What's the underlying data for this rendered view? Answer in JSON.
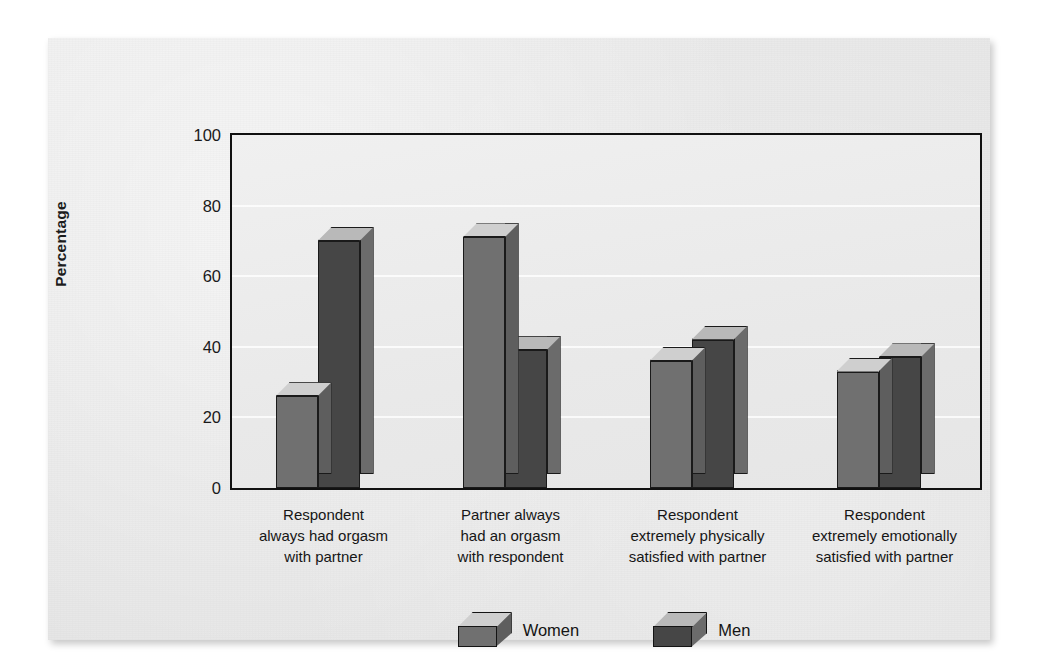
{
  "chart_data": {
    "type": "bar",
    "title": "",
    "xlabel": "",
    "ylabel": "Percentage",
    "ylim": [
      0,
      100
    ],
    "yticks": [
      0,
      20,
      40,
      60,
      80,
      100
    ],
    "grid": true,
    "legend_position": "bottom-center",
    "categories": [
      "Respondent always had orgasm with partner",
      "Partner always had an orgasm with respondent",
      "Respondent extremely physically satisfied with partner",
      "Respondent extremely emotionally satisfied with partner"
    ],
    "category_lines": [
      [
        "Respondent",
        "always had orgasm",
        "with partner"
      ],
      [
        "Partner always",
        "had an orgasm",
        "with respondent"
      ],
      [
        "Respondent",
        "extremely physically",
        "satisfied with partner"
      ],
      [
        "Respondent",
        "extremely emotionally",
        "satisfied with partner"
      ]
    ],
    "series": [
      {
        "name": "Women",
        "color": "#707070",
        "values": [
          26,
          71,
          36,
          33
        ]
      },
      {
        "name": "Men",
        "color": "#464646",
        "values": [
          70,
          39,
          42,
          37
        ]
      }
    ]
  },
  "legend": {
    "items": [
      {
        "label": "Women"
      },
      {
        "label": "Men"
      }
    ]
  }
}
